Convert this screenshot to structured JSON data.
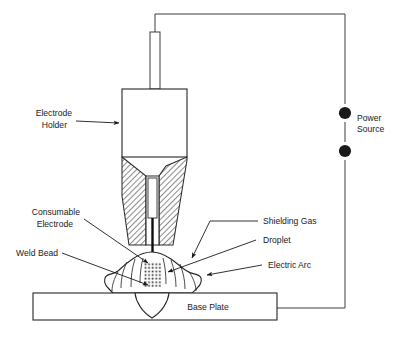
{
  "diagram": {
    "background_color": "#ffffff",
    "line_color": "#2b2b2b",
    "text_color": "#1a1a1a",
    "labels": {
      "electrode_holder_line1": "Electrode",
      "electrode_holder_line2": "Holder",
      "consumable_electrode_line1": "Consumable",
      "consumable_electrode_line2": "Electrode",
      "weld_bead": "Weld Bead",
      "shielding_gas": "Shielding Gas",
      "droplet": "Droplet",
      "electric_arc": "Electric Arc",
      "base_plate": "Base Plate",
      "power_source_line1": "Power",
      "power_source_line2": "Source"
    },
    "components": [
      {
        "name": "electrode-wire-tube",
        "label": ""
      },
      {
        "name": "electrode-holder-body",
        "label": "Electrode Holder"
      },
      {
        "name": "welding-nozzle",
        "label": ""
      },
      {
        "name": "consumable-electrode-wire",
        "label": "Consumable Electrode"
      },
      {
        "name": "shielding-gas-cloud",
        "label": "Shielding Gas"
      },
      {
        "name": "droplet-zone",
        "label": "Droplet"
      },
      {
        "name": "electric-arc-zone",
        "label": "Electric Arc"
      },
      {
        "name": "weld-bead",
        "label": "Weld Bead"
      },
      {
        "name": "base-plate",
        "label": "Base Plate"
      },
      {
        "name": "power-source-terminals",
        "label": "Power Source"
      },
      {
        "name": "circuit-wire",
        "label": ""
      }
    ]
  }
}
